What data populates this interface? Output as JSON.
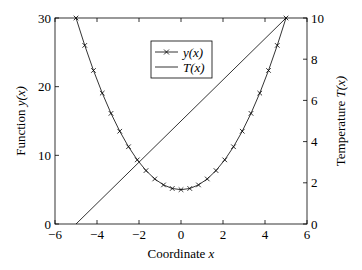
{
  "chart_data": {
    "type": "line",
    "title": "",
    "xlabel": "Coordinate x",
    "ylabel": "Function y(x)",
    "y2label": "Temperature T(x)",
    "xlim": [
      -6,
      6
    ],
    "ylim": [
      0,
      30
    ],
    "y2lim": [
      0,
      10
    ],
    "grid": false,
    "legend_position": "upper center",
    "x_ticks": [
      -6,
      -4,
      -2,
      0,
      2,
      4,
      6
    ],
    "y_ticks": [
      0,
      10,
      20,
      30
    ],
    "y2_ticks": [
      0,
      2,
      4,
      6,
      8,
      10
    ],
    "series": [
      {
        "name": "y(x)",
        "axis": "left",
        "marker": "x",
        "formula": "x^2 + 5",
        "x": [
          -5,
          -4.583,
          -4.167,
          -3.75,
          -3.333,
          -2.917,
          -2.5,
          -2.083,
          -1.667,
          -1.25,
          -0.833,
          -0.417,
          0,
          0.417,
          0.833,
          1.25,
          1.667,
          2.083,
          2.5,
          2.917,
          3.333,
          3.75,
          4.167,
          4.583,
          5
        ],
        "values": [
          30,
          26.01,
          22.36,
          19.06,
          16.11,
          13.51,
          11.25,
          9.34,
          7.78,
          6.56,
          5.69,
          5.17,
          5,
          5.17,
          5.69,
          6.56,
          7.78,
          9.34,
          11.25,
          13.51,
          16.11,
          19.06,
          22.36,
          26.01,
          30
        ]
      },
      {
        "name": "T(x)",
        "axis": "right",
        "marker": "none",
        "formula": "x + 5",
        "x": [
          -5,
          5
        ],
        "values": [
          0,
          10
        ]
      }
    ]
  },
  "labels": {
    "xlabel_text": "Coordinate ",
    "xlabel_var": "x",
    "ylabel_text": "Function ",
    "ylabel_var": "y(x)",
    "y2label_text": "Temperature ",
    "y2label_var": "T(x)",
    "legend_y": "y(x)",
    "legend_t": "T(x)"
  }
}
